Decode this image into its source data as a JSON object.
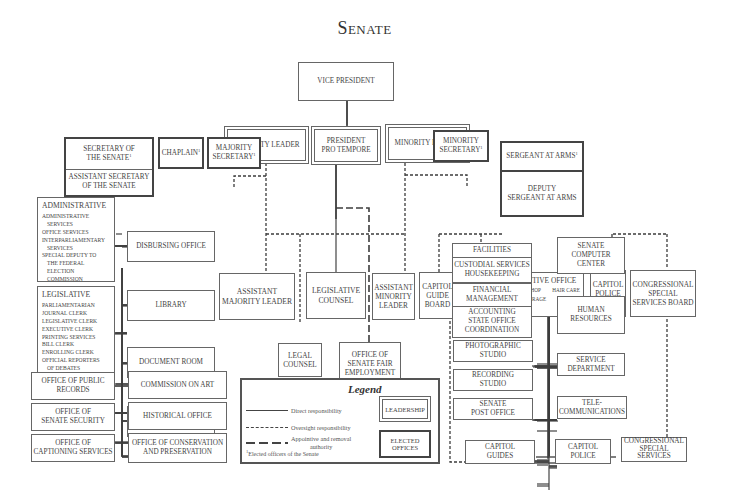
{
  "title": "Senate",
  "top": {
    "vice_president": "Vice President",
    "majority_leader": "Majority Leader",
    "president_pro_tempore": [
      "President",
      "Pro Tempore"
    ],
    "minority_leader": "Minority Leader"
  },
  "officers": {
    "secretary": [
      "Secretary of",
      "the Senate"
    ],
    "assistant_secretary": [
      "Assistant Secretary",
      "of the Senate"
    ],
    "chaplain": "Chaplain",
    "majority_secretary": [
      "Majority",
      "Secretary"
    ],
    "minority_secretary": [
      "Minority",
      "Secretary"
    ],
    "sergeant_at_arms": "Sergeant at Arms",
    "deputy_sergeant": [
      "Deputy",
      "Sergeant at Arms"
    ],
    "footnote_mark": "1"
  },
  "middle": {
    "assistant_majority_leader": [
      "Assistant",
      "Majority Leader"
    ],
    "legislative_counsel": [
      "Legislative",
      "Counsel"
    ],
    "assistant_minority_leader": [
      "Assistant",
      "Minority",
      "Leader"
    ],
    "legal_counsel": [
      "Legal",
      "Counsel"
    ],
    "senate_fair_employment": [
      "Office of",
      "Senate Fair",
      "Employment",
      "Practices"
    ]
  },
  "secretary_units": {
    "administrative": {
      "heading": "Administrative",
      "items": [
        {
          "text": "Administrative",
          "indent": false
        },
        {
          "text": "Services",
          "indent": true
        },
        {
          "text": "Office Services",
          "indent": false
        },
        {
          "text": "Interparliamentary",
          "indent": false
        },
        {
          "text": "Services",
          "indent": true
        },
        {
          "text": "Special Deputy to",
          "indent": false
        },
        {
          "text": "the Federal",
          "indent": true
        },
        {
          "text": "Election",
          "indent": true
        },
        {
          "text": "Commission",
          "indent": true
        }
      ]
    },
    "legislative": {
      "heading": "Legislative",
      "items": [
        {
          "text": "Parliamentarian",
          "indent": false
        },
        {
          "text": "Journal Clerk",
          "indent": false
        },
        {
          "text": "Legislative Clerk",
          "indent": false
        },
        {
          "text": "Executive Clerk",
          "indent": false
        },
        {
          "text": "Printing Services",
          "indent": false
        },
        {
          "text": "Bill Clerk",
          "indent": false
        },
        {
          "text": "Enrolling Clerk",
          "indent": false
        },
        {
          "text": "Official Reporters",
          "indent": false
        },
        {
          "text": "of Debates",
          "indent": true
        },
        {
          "text": "Senate Daily Digest",
          "indent": false
        }
      ]
    },
    "right_column": [
      "Disbursing Office",
      "Library",
      "Document Room",
      "Stationery Room"
    ],
    "bottom_left": [
      [
        "Office of Public",
        "Records"
      ],
      [
        "Office of",
        "Senate Security"
      ],
      [
        "Office of",
        "Captioning Services"
      ]
    ],
    "bottom_right": [
      [
        "Commission on Art"
      ],
      [
        "Historical Office"
      ],
      [
        "Office of Conservation",
        "and Preservation"
      ]
    ]
  },
  "sergeant_units": {
    "capitol_guide_board": [
      "Capitol",
      "Guide",
      "Board"
    ],
    "media_galleries": [
      "Media",
      "Galleries"
    ],
    "executive_office": {
      "heading": "Executive Office",
      "sub": [
        "Cabinet Shop",
        "Hair Care",
        "Senate Garage",
        "Parking"
      ]
    },
    "capitol_police_board": [
      "Capitol",
      "Police",
      "Board"
    ],
    "congressional_special_services_board": [
      "Congressional",
      "Special",
      "Services Board"
    ],
    "left_column": [
      {
        "top": [
          "Facilities"
        ],
        "bottom": [
          "Custodial Services",
          "Housekeeping"
        ]
      },
      {
        "top": [
          "Financial",
          "Management"
        ],
        "bottom": [
          "Accounting",
          "State Office",
          "Coordination"
        ]
      },
      {
        "single": [
          "Photographic",
          "Studio"
        ]
      },
      {
        "single": [
          "Recording",
          "Studio"
        ]
      },
      {
        "single": [
          "Senate",
          "Post Office"
        ]
      }
    ],
    "right_column": [
      [
        "Senate",
        "Computer",
        "Center"
      ],
      [
        "Human",
        "Resources"
      ],
      [
        "Service",
        "Department"
      ],
      [
        "Tele-",
        "communications"
      ]
    ],
    "bottom": {
      "capitol_guides": [
        "Capitol",
        "Guides"
      ],
      "capitol_police": [
        "Capitol",
        "Police"
      ],
      "congressional_special_services": [
        "Congressional",
        "Special",
        "Services"
      ]
    }
  },
  "legend": {
    "title": "Legend",
    "direct": "Direct responsibility",
    "oversight": "Oversight responsibility",
    "appointive": [
      "Appointive and removal",
      "authority"
    ],
    "leadership_label": "Leadership",
    "elected_label": [
      "Elected",
      "Offices"
    ],
    "footnote_mark": "1",
    "footnote": "Elected officers of the Senate"
  },
  "colors": {
    "line": "#444444",
    "box_border": "#666666",
    "text": "#444444",
    "background": "#ffffff"
  }
}
